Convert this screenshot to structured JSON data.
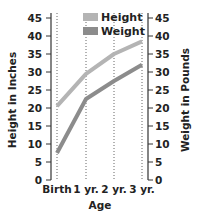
{
  "chart_data": {
    "type": "line",
    "title": "",
    "xlabel": "Age",
    "ylabel": "Height in Inches",
    "ylabel_right": "Weight in Pounds",
    "categories": [
      "Birth",
      "1 yr.",
      "2 yr.",
      "3 yr."
    ],
    "series": [
      {
        "name": "Height",
        "color": "#b4b4b4",
        "axis": "left",
        "values": [
          20.5,
          29.5,
          35,
          38.5
        ]
      },
      {
        "name": "Weight",
        "color": "#8c8c8c",
        "axis": "right",
        "values": [
          7.5,
          22.5,
          27.5,
          32
        ]
      }
    ],
    "ylim": [
      0,
      45
    ],
    "ylim_right": [
      0,
      45
    ],
    "yticks": [
      0,
      5,
      10,
      15,
      20,
      25,
      30,
      35,
      40,
      45
    ],
    "grid": "vertical dotted lines at each category",
    "legend_position": "upper center inside plot"
  },
  "labels": {
    "xlabel": "Age",
    "ylabel_left": "Height in Inches",
    "ylabel_right": "Weight in Pounds",
    "legend": [
      "Height",
      "Weight"
    ]
  }
}
